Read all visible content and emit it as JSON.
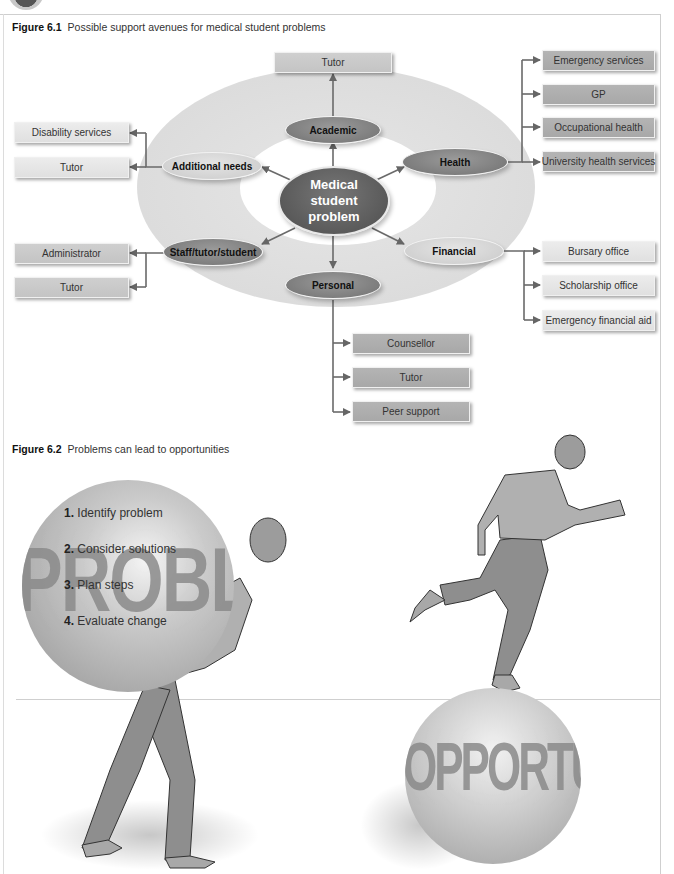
{
  "figures": [
    {
      "label": "Figure 6.1",
      "caption": "Possible support avenues for medical student problems",
      "type": "radial-diagram",
      "center": "Medical student problem",
      "branches": [
        {
          "category": "Academic",
          "style": "dark",
          "destinations": [
            "Tutor"
          ]
        },
        {
          "category": "Health",
          "style": "dark",
          "destinations": [
            "Emergency services",
            "GP",
            "Occupational health",
            "University health services"
          ]
        },
        {
          "category": "Financial",
          "style": "light",
          "destinations": [
            "Bursary office",
            "Scholarship office",
            "Emergency financial aid"
          ]
        },
        {
          "category": "Personal",
          "style": "dark",
          "destinations": [
            "Counsellor",
            "Tutor",
            "Peer support"
          ]
        },
        {
          "category": "Staff/tutor/student",
          "style": "dark",
          "destinations": [
            "Administrator",
            "Tutor"
          ]
        },
        {
          "category": "Additional needs",
          "style": "light",
          "destinations": [
            "Disability services",
            "Tutor"
          ]
        }
      ]
    },
    {
      "label": "Figure 6.2",
      "caption": "Problems can lead to opportunities",
      "type": "illustration",
      "problem_ball_word": "PROBLEM",
      "steps": [
        {
          "num": "1.",
          "text": "Identify problem"
        },
        {
          "num": "2.",
          "text": "Consider solutions"
        },
        {
          "num": "3.",
          "text": "Plan steps"
        },
        {
          "num": "4.",
          "text": "Evaluate change"
        }
      ],
      "opportunity_ball_word": "OPPORTUNITY"
    }
  ],
  "colors": {
    "node_dark": "#7d7d7d",
    "node_light": "#d2d2d2",
    "center_node": "#555555",
    "ring": "#dcdcdc",
    "connector": "#666666"
  }
}
